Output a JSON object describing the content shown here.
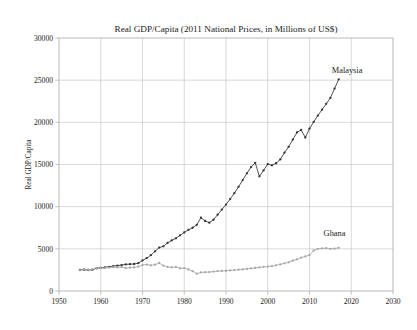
{
  "figure": {
    "width": 417,
    "height": 330,
    "background": "#ffffff"
  },
  "chart_data": {
    "type": "line",
    "title": "Real GDP/Capita (2011 National Prices, in Millions of US$)",
    "xlabel": "",
    "ylabel": "Real GDP/Capita",
    "xlim": [
      1950,
      2030
    ],
    "ylim": [
      0,
      30000
    ],
    "grid": true,
    "legend_position": "inline-annotation",
    "xticks": [
      1950,
      1960,
      1970,
      1980,
      1990,
      2000,
      2010,
      2020,
      2030
    ],
    "xticklabels": [
      "1950",
      "1960",
      "1970",
      "1980",
      "1990",
      "2000",
      "2010",
      "2020",
      "2030"
    ],
    "yticks": [
      0,
      5000,
      10000,
      15000,
      20000,
      25000,
      30000
    ],
    "yticklabels": [
      "0",
      "5000",
      "10000",
      "15000",
      "20000",
      "25000",
      "30000"
    ],
    "x": [
      1955,
      1956,
      1957,
      1958,
      1959,
      1960,
      1961,
      1962,
      1963,
      1964,
      1965,
      1966,
      1967,
      1968,
      1969,
      1970,
      1971,
      1972,
      1973,
      1974,
      1975,
      1976,
      1977,
      1978,
      1979,
      1980,
      1981,
      1982,
      1983,
      1984,
      1985,
      1986,
      1987,
      1988,
      1989,
      1990,
      1991,
      1992,
      1993,
      1994,
      1995,
      1996,
      1997,
      1998,
      1999,
      2000,
      2001,
      2002,
      2003,
      2004,
      2005,
      2006,
      2007,
      2008,
      2009,
      2010,
      2011,
      2012,
      2013,
      2014,
      2015,
      2016,
      2017
    ],
    "series": [
      {
        "name": "Malaysia",
        "color": "#333333",
        "marker": "dot",
        "values": [
          2500,
          2530,
          2480,
          2520,
          2700,
          2750,
          2800,
          2870,
          2950,
          3000,
          3080,
          3150,
          3180,
          3200,
          3300,
          3620,
          3900,
          4250,
          4700,
          5150,
          5300,
          5700,
          6000,
          6250,
          6600,
          6950,
          7250,
          7500,
          7850,
          8700,
          8300,
          8100,
          8450,
          9050,
          9650,
          10250,
          10900,
          11600,
          12350,
          13150,
          13950,
          14700,
          15200,
          13600,
          14300,
          15050,
          14900,
          15150,
          15600,
          16400,
          17100,
          17950,
          18800,
          19100,
          18200,
          19250,
          20050,
          20800,
          21500,
          22200,
          22900,
          24000,
          25100
        ]
      },
      {
        "name": "Ghana",
        "color": "#a8a8a8",
        "marker": "dot",
        "values": [
          2450,
          2600,
          2520,
          2560,
          2720,
          2700,
          2720,
          2780,
          2820,
          2800,
          2830,
          2720,
          2760,
          2800,
          2900,
          3080,
          3130,
          3050,
          3120,
          3320,
          3000,
          2850,
          2800,
          2850,
          2700,
          2720,
          2550,
          2350,
          2050,
          2200,
          2230,
          2250,
          2300,
          2350,
          2380,
          2400,
          2450,
          2480,
          2530,
          2560,
          2620,
          2680,
          2740,
          2800,
          2870,
          2900,
          2950,
          3050,
          3150,
          3280,
          3400,
          3600,
          3750,
          3950,
          4100,
          4250,
          4800,
          5000,
          5050,
          5080,
          5000,
          5030,
          5120
        ]
      }
    ],
    "annotations": [
      {
        "text": "Malaysia",
        "x": 2019,
        "y": 25800
      },
      {
        "text": "Ghana",
        "x": 2016,
        "y": 6500
      }
    ]
  },
  "style": {
    "frame_color": "#b9b9b9",
    "grid_color": "#c9c9c9",
    "text_color": "#1a1a1a"
  }
}
